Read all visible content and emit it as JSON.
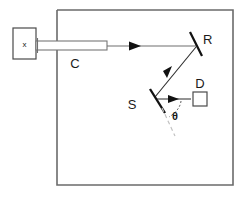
{
  "figure": {
    "title": "",
    "type": "optical-beam-path-schematic",
    "background_color": "#ffffff",
    "frame": {
      "label": "enclosure",
      "x": 57,
      "y": 10,
      "width": 176,
      "height": 175,
      "stroke_color": "#6b6b6b"
    },
    "components": [
      {
        "id": "source",
        "label": "x",
        "kind": "box",
        "x": 13,
        "y": 28,
        "width": 23,
        "height": 31
      },
      {
        "id": "collimator",
        "label": "C",
        "kind": "tube",
        "x": 36,
        "y": 41,
        "width": 71,
        "height": 9,
        "label_x": 75,
        "label_y": 64
      },
      {
        "id": "mirror-r",
        "label": "R",
        "kind": "mirror",
        "x1": 190,
        "y1": 32,
        "x2": 202,
        "y2": 56,
        "label_x": 203,
        "label_y": 44
      },
      {
        "id": "mirror-s",
        "label": "S",
        "kind": "mirror",
        "x1": 150,
        "y1": 89,
        "x2": 165,
        "y2": 113,
        "label_x": 132,
        "label_y": 109
      },
      {
        "id": "detector",
        "label": "D",
        "kind": "box",
        "x": 193,
        "y": 92,
        "width": 14,
        "height": 14,
        "label_x": 196,
        "label_y": 88
      }
    ],
    "beams": [
      {
        "id": "beam-source-to-r",
        "from": "collimator",
        "to": "mirror-r",
        "direction": "right",
        "x1": 107,
        "y1": 46,
        "x2": 196,
        "y2": 46
      },
      {
        "id": "beam-r-to-s",
        "from": "mirror-r",
        "to": "mirror-s",
        "direction": "down-left",
        "x1": 197,
        "y1": 47,
        "x2": 156,
        "y2": 96
      },
      {
        "id": "beam-s-to-d",
        "from": "mirror-s",
        "to": "detector",
        "direction": "right",
        "x1": 158,
        "y1": 99,
        "x2": 192,
        "y2": 99
      }
    ],
    "annotations": [
      {
        "id": "mirror-s-normal",
        "kind": "dashed-line",
        "label": "mirror-extension",
        "x1": 160,
        "y1": 106,
        "x2": 174,
        "y2": 134
      },
      {
        "id": "angle-theta",
        "kind": "angle",
        "symbol": "θ",
        "label": "theta",
        "label_x": 172,
        "label_y": 116
      }
    ],
    "colors": {
      "ink": "#1a1a1a",
      "frame": "#6b6b6b",
      "beam": "#6f6f6f",
      "mirror": "#111111",
      "dashed": "#c2c2c2"
    }
  }
}
